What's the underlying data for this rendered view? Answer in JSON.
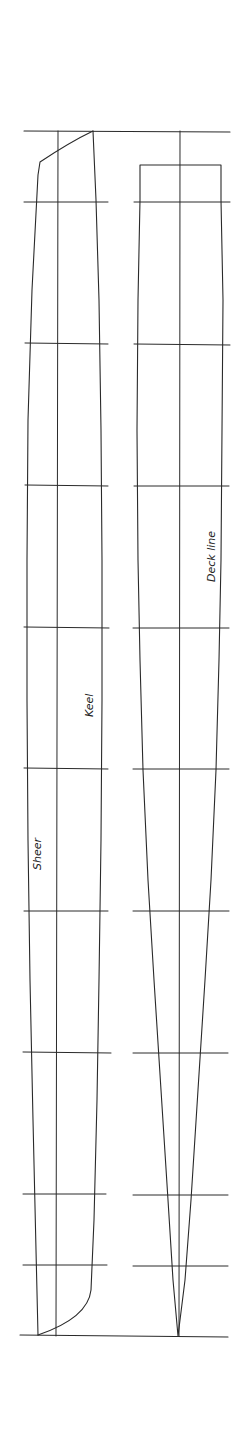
{
  "drawing": {
    "title": "Hull lines plan (sheer / keel / deck line)",
    "background": "#ffffff",
    "ink_color": "#2a2a2a",
    "labels": {
      "sheer": "Sheer",
      "keel": "Keel",
      "deck_line": "Deck line"
    },
    "top_line_y": 131,
    "baseline_y": 1336,
    "station_lines_y": [
      202,
      343,
      485,
      627,
      768,
      911,
      1053,
      1194,
      1265
    ],
    "profile_view": {
      "station_x_range": [
        24,
        108
      ],
      "centerline_x": 58,
      "sheer_top": [
        38,
        162
      ],
      "bow_top": [
        93,
        131
      ]
    },
    "plan_view": {
      "station_x_range": [
        134,
        230
      ],
      "centerline_x": 180,
      "box_top_y": 165,
      "box_x_range": [
        140,
        221
      ],
      "point_apex": [
        178,
        1336
      ]
    }
  }
}
